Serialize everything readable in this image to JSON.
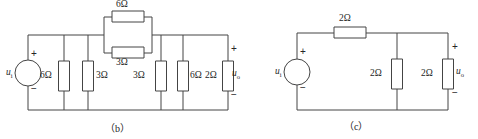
{
  "figure": {
    "panels": [
      {
        "id": "b",
        "caption": "（b）",
        "source": {
          "name": "u",
          "sub": "i",
          "plus": "+",
          "minus": "−"
        },
        "output": {
          "name": "u",
          "sub": "o",
          "plus": "+",
          "minus": "−"
        },
        "top_parallel": {
          "upper": "6Ω",
          "lower": "3Ω"
        },
        "shunts": [
          "6Ω",
          "3Ω",
          "3Ω",
          "6Ω",
          "2Ω"
        ],
        "load": "2Ω"
      },
      {
        "id": "c",
        "caption": "（c）",
        "source": {
          "name": "u",
          "sub": "i",
          "plus": "+",
          "minus": "−"
        },
        "output": {
          "name": "u",
          "sub": "o",
          "plus": "+",
          "minus": "−"
        },
        "series": "2Ω",
        "shunts": [
          "2Ω"
        ],
        "load": "2Ω"
      }
    ],
    "colors": {
      "wire": "#444444",
      "text": "#262626",
      "background": "#ffffff"
    }
  }
}
